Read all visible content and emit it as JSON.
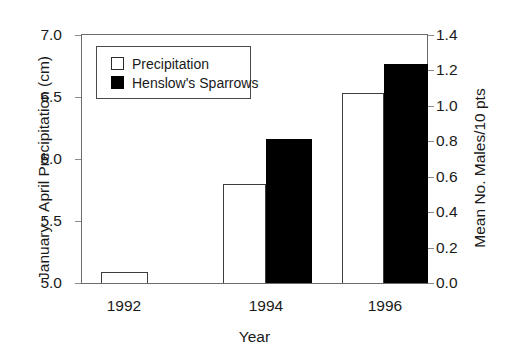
{
  "chart_data": {
    "type": "bar",
    "title": "",
    "xlabel": "Year",
    "categories": [
      "1992",
      "1994",
      "1996"
    ],
    "grid": false,
    "legend_position": "upper-left",
    "axes": {
      "left": {
        "label": "January - April Precipitation (cm)",
        "ylim": [
          5.0,
          7.0
        ],
        "ticks": [
          "7.0",
          "6.5",
          "6.0",
          "5.5",
          "5.0"
        ],
        "tick_values": [
          7.0,
          6.5,
          6.0,
          5.5,
          5.0
        ]
      },
      "right": {
        "label": "Mean No. Males/10 pts",
        "ylim": [
          0.0,
          1.4
        ],
        "ticks": [
          "1.4",
          "1.2",
          "1.0",
          "0.8",
          "0.6",
          "0.4",
          "0.2",
          "0.0"
        ],
        "tick_values": [
          1.4,
          1.2,
          1.0,
          0.8,
          0.6,
          0.4,
          0.2,
          0.0
        ]
      }
    },
    "series": [
      {
        "name": "Precipitation",
        "axis": "left",
        "style": "open",
        "color": "#ffffff",
        "edge_color": "#3d3d3d",
        "values": [
          5.1,
          5.8,
          6.53
        ]
      },
      {
        "name": "Henslow's Sparrows",
        "axis": "right",
        "style": "filled",
        "color": "#000000",
        "edge_color": "#000000",
        "values": [
          null,
          0.81,
          1.23
        ]
      }
    ]
  },
  "legend": {
    "items": [
      {
        "label": "Precipitation",
        "swatch": "open-square"
      },
      {
        "label": "Henslow's Sparrows",
        "swatch": "filled-square"
      }
    ]
  },
  "ticks": {
    "left": [
      "7.0",
      "6.5",
      "6.0",
      "5.5",
      "5.0"
    ],
    "right": [
      "1.4",
      "1.2",
      "1.0",
      "0.8",
      "0.6",
      "0.4",
      "0.2",
      "0.0"
    ]
  },
  "labels": {
    "y_left": "January - April Precipitation (cm)",
    "y_right": "Mean No. Males/10 pts",
    "x": "Year",
    "categories": [
      "1992",
      "1994",
      "1996"
    ]
  }
}
